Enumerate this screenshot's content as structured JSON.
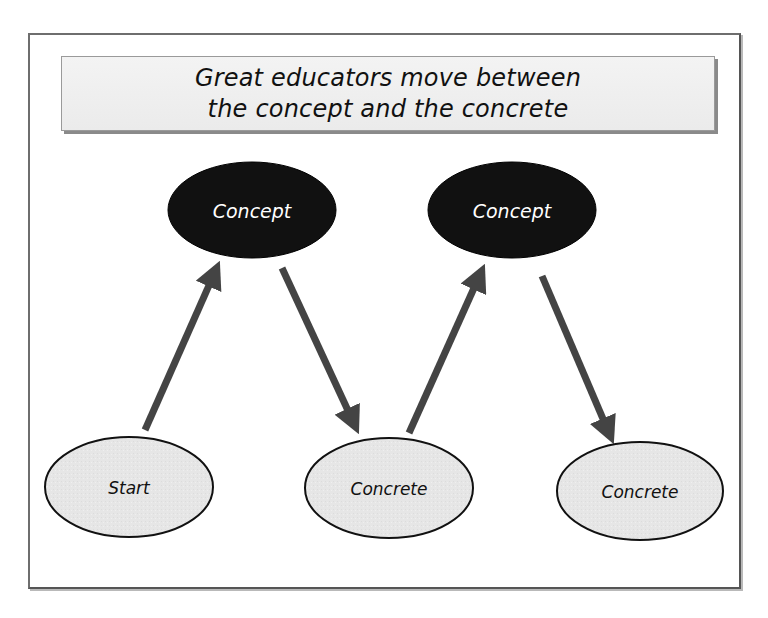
{
  "caption_cut": "",
  "title": {
    "line1": "Great educators move between",
    "line2": "the concept and the concrete"
  },
  "colors": {
    "concept_fill": "#111111",
    "concrete_fill": "#e6e6e6",
    "arrow": "#444444",
    "frame_border": "#6e6e6e"
  },
  "nodes": [
    {
      "id": "concept-1",
      "type": "concept",
      "label": "Concept",
      "cx": 252,
      "cy": 210,
      "rx": 84,
      "ry": 48
    },
    {
      "id": "concept-2",
      "type": "concept",
      "label": "Concept",
      "cx": 512,
      "cy": 210,
      "rx": 84,
      "ry": 48
    },
    {
      "id": "start",
      "type": "concrete",
      "label": "Start",
      "cx": 129,
      "cy": 487,
      "rx": 84,
      "ry": 50
    },
    {
      "id": "concrete-1",
      "type": "concrete",
      "label": "Concrete",
      "cx": 389,
      "cy": 488,
      "rx": 84,
      "ry": 50
    },
    {
      "id": "concrete-2",
      "type": "concrete",
      "label": "Concrete",
      "cx": 640,
      "cy": 491,
      "rx": 83,
      "ry": 49
    }
  ],
  "edges": [
    {
      "from": "start",
      "to": "concept-1",
      "x1": 145,
      "y1": 430,
      "x2": 218,
      "y2": 265
    },
    {
      "from": "concept-1",
      "to": "concrete-1",
      "x1": 282,
      "y1": 268,
      "x2": 357,
      "y2": 430
    },
    {
      "from": "concrete-1",
      "to": "concept-2",
      "x1": 409,
      "y1": 433,
      "x2": 483,
      "y2": 268
    },
    {
      "from": "concept-2",
      "to": "concrete-2",
      "x1": 542,
      "y1": 276,
      "x2": 612,
      "y2": 440
    }
  ]
}
